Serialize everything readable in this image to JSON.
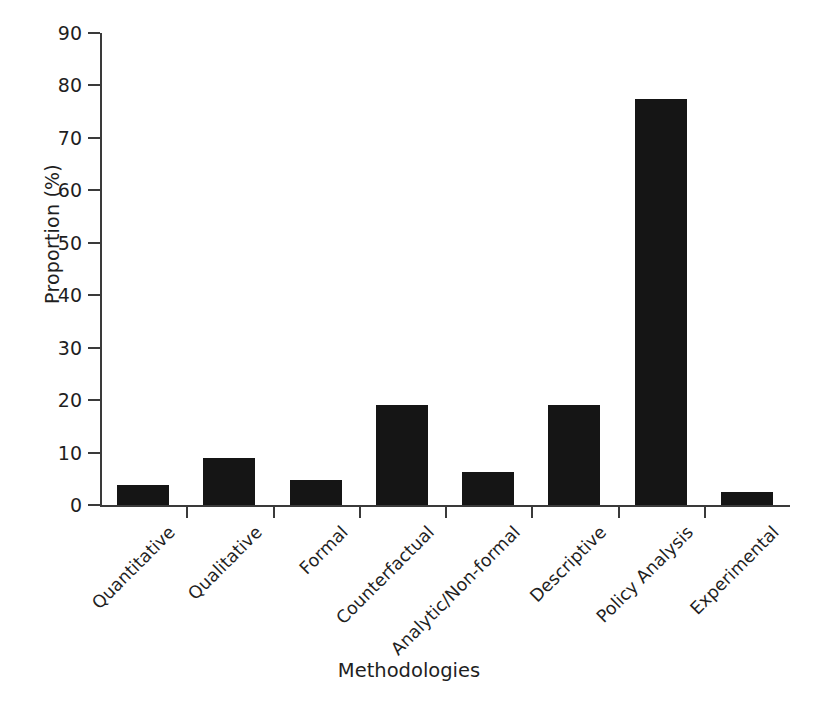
{
  "chart_data": {
    "type": "bar",
    "title": "",
    "xlabel": "Methodologies",
    "ylabel": "Proportion (%)",
    "categories": [
      "Quantitative",
      "Qualitative",
      "Formal",
      "Counterfactual",
      "Analytic/Non-formal",
      "Descriptive",
      "Policy Analysis",
      "Experimental"
    ],
    "values": [
      3.8,
      9.0,
      4.8,
      19.0,
      6.3,
      19.0,
      77.5,
      2.4
    ],
    "ylim": [
      0,
      90
    ],
    "yticks": [
      0,
      10,
      20,
      30,
      40,
      50,
      60,
      70,
      80,
      90
    ],
    "ytick_labels": [
      "0",
      "10",
      "20",
      "30",
      "40",
      "50",
      "60",
      "70",
      "80",
      "90"
    ],
    "grid": false,
    "legend": null,
    "bar_color": "#151515",
    "axis_color": "#3a3a3a",
    "background": "#ffffff"
  }
}
